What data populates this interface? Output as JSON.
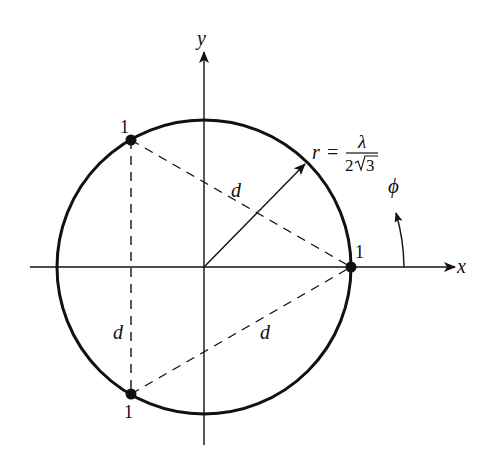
{
  "diagram": {
    "axes": {
      "x_label": "x",
      "y_label": "y",
      "angle_label": "ϕ"
    },
    "radius_label": {
      "lhs": "r =",
      "numerator": "λ",
      "denominator_coeff": "2",
      "denominator_root": "3"
    },
    "points": [
      {
        "id": "p1",
        "label": "1",
        "angle_deg": 0
      },
      {
        "id": "p2",
        "label": "1",
        "angle_deg": 120
      },
      {
        "id": "p3",
        "label": "1",
        "angle_deg": 240
      }
    ],
    "distance_labels": {
      "top": "d",
      "left": "d",
      "bottom": "d"
    },
    "colors": {
      "stroke": "#111111",
      "background": "#ffffff"
    }
  }
}
